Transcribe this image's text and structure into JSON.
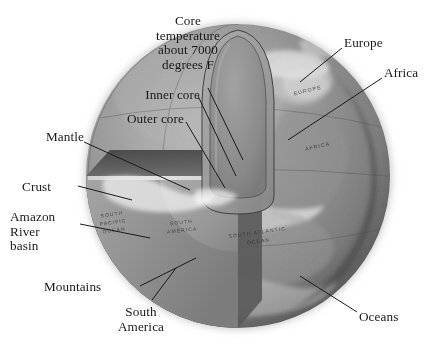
{
  "figure": {
    "title_semantic": "cutaway-earth-diagram",
    "palette": {
      "background": "#ffffff",
      "globe_light": "#a9a9a9",
      "globe_mid": "#8d8d8d",
      "globe_dark": "#595959",
      "globe_edge_shadow": "#3f3f3f",
      "wedge_notch_dark": "#4f4f4f",
      "mantle_face": "#909090",
      "outer_core": "#9b9b9b",
      "inner_core": "#8a8a8a",
      "crust_highlight": "#e8e8e8",
      "cloud_white": "#f2f2f2",
      "leader_line": "#1a1a1a",
      "label_text": "#191919"
    },
    "globe": {
      "center_x": 238,
      "center_y": 176,
      "radius": 152
    }
  },
  "callouts": [
    {
      "id": "core-temperature",
      "text": "Core\ntemperature\nabout 7000\ndegrees F",
      "align": "center",
      "x": 136,
      "y": 14,
      "width": 104
    },
    {
      "id": "inner-core",
      "text": "Inner core",
      "align": "right",
      "x": 92,
      "y": 88,
      "width": 108
    },
    {
      "id": "outer-core",
      "text": "Outer core",
      "align": "right",
      "x": 72,
      "y": 112,
      "width": 112
    },
    {
      "id": "mantle",
      "text": "Mantle",
      "align": "right",
      "x": 18,
      "y": 130,
      "width": 66
    },
    {
      "id": "crust",
      "text": "Crust",
      "align": "left",
      "x": 22,
      "y": 180,
      "width": 56
    },
    {
      "id": "amazon-river-basin",
      "text": "Amazon\nRiver\nbasin",
      "align": "left",
      "x": 10,
      "y": 210,
      "width": 70
    },
    {
      "id": "mountains",
      "text": "Mountains",
      "align": "left",
      "x": 44,
      "y": 280,
      "width": 96
    },
    {
      "id": "south-america",
      "text": "South\nAmerica",
      "align": "center",
      "x": 104,
      "y": 305,
      "width": 74
    },
    {
      "id": "europe",
      "text": "Europe",
      "align": "left",
      "x": 344,
      "y": 36,
      "width": 70
    },
    {
      "id": "africa",
      "text": "Africa",
      "align": "left",
      "x": 384,
      "y": 66,
      "width": 60
    },
    {
      "id": "oceans",
      "text": "Oceans",
      "align": "left",
      "x": 359,
      "y": 310,
      "width": 66
    }
  ],
  "leader_lines": [
    {
      "id": "leader-core-temperature",
      "from": [
        208,
        88
      ],
      "to": [
        243,
        160
      ]
    },
    {
      "id": "leader-inner-core",
      "from": [
        198,
        96
      ],
      "to": [
        236,
        176
      ]
    },
    {
      "id": "leader-outer-core",
      "from": [
        186,
        122
      ],
      "to": [
        225,
        188
      ]
    },
    {
      "id": "leader-mantle",
      "from": [
        84,
        142
      ],
      "to": [
        190,
        190
      ]
    },
    {
      "id": "leader-crust",
      "from": [
        78,
        186
      ],
      "to": [
        132,
        200
      ]
    },
    {
      "id": "leader-amazon",
      "from": [
        80,
        224
      ],
      "to": [
        150,
        238
      ]
    },
    {
      "id": "leader-mountains",
      "from": [
        140,
        286
      ],
      "to": [
        196,
        258
      ]
    },
    {
      "id": "leader-south-america",
      "from": [
        152,
        300
      ],
      "to": [
        176,
        268
      ]
    },
    {
      "id": "leader-europe",
      "from": [
        342,
        48
      ],
      "to": [
        300,
        82
      ]
    },
    {
      "id": "leader-africa",
      "from": [
        382,
        78
      ],
      "to": [
        288,
        140
      ]
    },
    {
      "id": "leader-oceans",
      "from": [
        357,
        312
      ],
      "to": [
        300,
        276
      ]
    }
  ],
  "map_labels": [
    {
      "id": "map-label-europe",
      "text": "EUROPE",
      "x": 308,
      "y": 92,
      "rotate": -14,
      "size": 5.2
    },
    {
      "id": "map-label-africa",
      "text": "AFRICA",
      "x": 318,
      "y": 148,
      "rotate": -12,
      "size": 5.2
    },
    {
      "id": "map-label-south-pacific",
      "text": "SOUTH\nPACIFIC\nOCEAN",
      "x": 113,
      "y": 222,
      "rotate": -8,
      "size": 5.0
    },
    {
      "id": "map-label-south-america",
      "text": "SOUTH\nAMERICA",
      "x": 182,
      "y": 228,
      "rotate": -6,
      "size": 5.0
    },
    {
      "id": "map-label-south-atlantic",
      "text": "SOUTH ATLANTIC\nOCEAN",
      "x": 238,
      "y": 236,
      "rotate": -8,
      "size": 5.0
    }
  ]
}
